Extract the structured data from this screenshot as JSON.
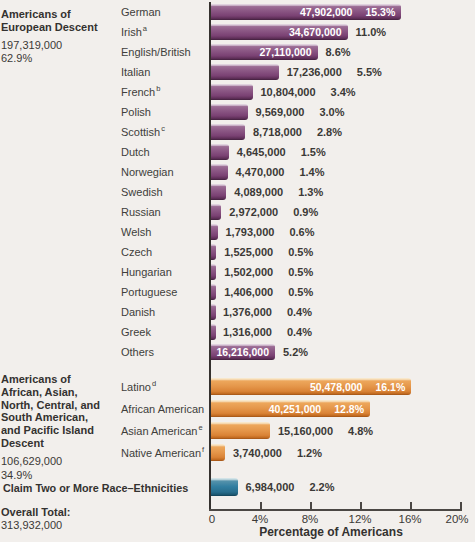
{
  "annotations": {
    "european": {
      "title": "Americans of\nEuropean Descent",
      "total": "197,319,000",
      "pct": "62.9%"
    },
    "minority": {
      "title": "Americans of\nAfrican, Asian,\nNorth, Central, and\nSouth American,\nand Pacific Island\nDescent",
      "total": "106,629,000",
      "pct": "34.9%"
    },
    "claim": {
      "title": "Claim Two or More Race–Ethnicities"
    },
    "overall": {
      "title": "Overall Total:",
      "total": "313,932,000"
    }
  },
  "colors": {
    "purple": "#8a5583",
    "orange": "#e5974b",
    "teal": "#327ea0",
    "background": "#f2efec",
    "text": "#3b3936"
  },
  "chart_data": {
    "type": "bar",
    "xlabel": "Percentage of Americans",
    "xlim": [
      0,
      20
    ],
    "x_ticks": [
      {
        "x": 0,
        "label": "0"
      },
      {
        "x": 4,
        "label": "4%"
      },
      {
        "x": 8,
        "label": "8%"
      },
      {
        "x": 12,
        "label": "12%"
      },
      {
        "x": 16,
        "label": "16%"
      },
      {
        "x": 20,
        "label": "20%"
      }
    ],
    "groups": [
      {
        "name": "european-descent",
        "style": "purple",
        "rows": [
          {
            "label": "German",
            "sup": "",
            "value": "47,902,000",
            "pct": 15.3,
            "pct_label": "15.3%",
            "value_inside": true,
            "pct_inside": true
          },
          {
            "label": "Irish",
            "sup": "a",
            "value": "34,670,000",
            "pct": 11.0,
            "pct_label": "11.0%",
            "value_inside": true,
            "pct_inside": false
          },
          {
            "label": "English/British",
            "sup": "",
            "value": "27,110,000",
            "pct": 8.6,
            "pct_label": "8.6%",
            "value_inside": true,
            "pct_inside": false
          },
          {
            "label": "Italian",
            "sup": "",
            "value": "17,236,000",
            "pct": 5.5,
            "pct_label": "5.5%",
            "value_inside": false,
            "pct_inside": false
          },
          {
            "label": "French",
            "sup": "b",
            "value": "10,804,000",
            "pct": 3.4,
            "pct_label": "3.4%",
            "value_inside": false,
            "pct_inside": false
          },
          {
            "label": "Polish",
            "sup": "",
            "value": "9,569,000",
            "pct": 3.0,
            "pct_label": "3.0%",
            "value_inside": false,
            "pct_inside": false
          },
          {
            "label": "Scottish",
            "sup": "c",
            "value": "8,718,000",
            "pct": 2.8,
            "pct_label": "2.8%",
            "value_inside": false,
            "pct_inside": false
          },
          {
            "label": "Dutch",
            "sup": "",
            "value": "4,645,000",
            "pct": 1.5,
            "pct_label": "1.5%",
            "value_inside": false,
            "pct_inside": false
          },
          {
            "label": "Norwegian",
            "sup": "",
            "value": "4,470,000",
            "pct": 1.4,
            "pct_label": "1.4%",
            "value_inside": false,
            "pct_inside": false
          },
          {
            "label": "Swedish",
            "sup": "",
            "value": "4,089,000",
            "pct": 1.3,
            "pct_label": "1.3%",
            "value_inside": false,
            "pct_inside": false
          },
          {
            "label": "Russian",
            "sup": "",
            "value": "2,972,000",
            "pct": 0.9,
            "pct_label": "0.9%",
            "value_inside": false,
            "pct_inside": false
          },
          {
            "label": "Welsh",
            "sup": "",
            "value": "1,793,000",
            "pct": 0.6,
            "pct_label": "0.6%",
            "value_inside": false,
            "pct_inside": false
          },
          {
            "label": "Czech",
            "sup": "",
            "value": "1,525,000",
            "pct": 0.5,
            "pct_label": "0.5%",
            "value_inside": false,
            "pct_inside": false
          },
          {
            "label": "Hungarian",
            "sup": "",
            "value": "1,502,000",
            "pct": 0.5,
            "pct_label": "0.5%",
            "value_inside": false,
            "pct_inside": false
          },
          {
            "label": "Portuguese",
            "sup": "",
            "value": "1,406,000",
            "pct": 0.5,
            "pct_label": "0.5%",
            "value_inside": false,
            "pct_inside": false
          },
          {
            "label": "Danish",
            "sup": "",
            "value": "1,376,000",
            "pct": 0.4,
            "pct_label": "0.4%",
            "value_inside": false,
            "pct_inside": false
          },
          {
            "label": "Greek",
            "sup": "",
            "value": "1,316,000",
            "pct": 0.4,
            "pct_label": "0.4%",
            "value_inside": false,
            "pct_inside": false
          },
          {
            "label": "Others",
            "sup": "",
            "value": "16,216,000",
            "pct": 5.2,
            "pct_label": "5.2%",
            "value_inside": true,
            "pct_inside": false
          }
        ]
      },
      {
        "name": "non-european-descent",
        "style": "orange",
        "rows": [
          {
            "label": "Latino",
            "sup": "d",
            "value": "50,478,000",
            "pct": 16.1,
            "pct_label": "16.1%",
            "value_inside": true,
            "pct_inside": true
          },
          {
            "label": "African American",
            "sup": "",
            "value": "40,251,000",
            "pct": 12.8,
            "pct_label": "12.8%",
            "value_inside": true,
            "pct_inside": true
          },
          {
            "label": "Asian American",
            "sup": "e",
            "value": "15,160,000",
            "pct": 4.8,
            "pct_label": "4.8%",
            "value_inside": false,
            "pct_inside": false
          },
          {
            "label": "Native American",
            "sup": "f",
            "value": "3,740,000",
            "pct": 1.2,
            "pct_label": "1.2%",
            "value_inside": false,
            "pct_inside": false
          }
        ]
      },
      {
        "name": "two-or-more-race-ethnicities",
        "style": "teal",
        "rows": [
          {
            "label": "",
            "sup": "",
            "value": "6,984,000",
            "pct": 2.2,
            "pct_label": "2.2%",
            "value_inside": false,
            "pct_inside": false
          }
        ]
      }
    ]
  }
}
